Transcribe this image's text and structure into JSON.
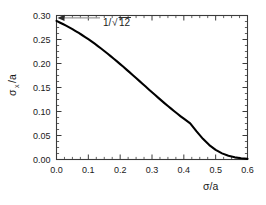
{
  "chart_data": {
    "type": "line",
    "title": "",
    "xlabel": "σ/a",
    "ylabel": "σₓ/a",
    "ylabel_base": "σ",
    "ylabel_sub": "x",
    "ylabel_tail": "/a",
    "xlim": [
      0.0,
      0.6
    ],
    "ylim": [
      0.0,
      0.3
    ],
    "grid": false,
    "legend": "none",
    "xticks": [
      0.0,
      0.1,
      0.2,
      0.3,
      0.4,
      0.5,
      0.6
    ],
    "xtick_labels": [
      "0.0",
      "0.1",
      "0.2",
      "0.3",
      "0.4",
      "0.5",
      "0.6"
    ],
    "yticks": [
      0.0,
      0.05,
      0.1,
      0.15,
      0.2,
      0.25,
      0.3
    ],
    "ytick_labels": [
      "0.00",
      "0.05",
      "0.10",
      "0.15",
      "0.20",
      "0.25",
      "0.30"
    ],
    "xminor_step": 0.025,
    "yminor_step": 0.0125,
    "annotations": [
      {
        "text": "1/√12",
        "text_prefix": "1/",
        "text_radical": "√",
        "text_radicand": "12",
        "points_to_x": 0.0,
        "points_to_y": 0.2887,
        "value": 0.2887
      }
    ],
    "series": [
      {
        "name": "sigma_x over a",
        "x": [
          0.0,
          0.01,
          0.02,
          0.03,
          0.04,
          0.05,
          0.06,
          0.07,
          0.08,
          0.09,
          0.1,
          0.11,
          0.12,
          0.13,
          0.14,
          0.15,
          0.16,
          0.17,
          0.18,
          0.19,
          0.2,
          0.21,
          0.22,
          0.23,
          0.24,
          0.25,
          0.26,
          0.27,
          0.28,
          0.29,
          0.3,
          0.31,
          0.32,
          0.33,
          0.34,
          0.35,
          0.36,
          0.37,
          0.38,
          0.39,
          0.4,
          0.42,
          0.44,
          0.46,
          0.48,
          0.5,
          0.52,
          0.54,
          0.56,
          0.58,
          0.6
        ],
        "y": [
          0.2887,
          0.2855,
          0.2822,
          0.2788,
          0.2752,
          0.2715,
          0.2676,
          0.2636,
          0.2594,
          0.2551,
          0.2506,
          0.246,
          0.2412,
          0.2363,
          0.2313,
          0.2261,
          0.2209,
          0.2155,
          0.21,
          0.2045,
          0.1988,
          0.1931,
          0.1873,
          0.1815,
          0.1756,
          0.1697,
          0.1638,
          0.1578,
          0.1519,
          0.146,
          0.1401,
          0.1342,
          0.1284,
          0.1227,
          0.117,
          0.1114,
          0.1059,
          0.1005,
          0.0952,
          0.09,
          0.085,
          0.0754,
          0.0585,
          0.043,
          0.03,
          0.02,
          0.0128,
          0.0078,
          0.0045,
          0.0025,
          0.0013
        ]
      }
    ]
  },
  "figure": {
    "alt": "Plot of sigma_x/a versus sigma/a decaying from 1 over root 12 to zero"
  }
}
